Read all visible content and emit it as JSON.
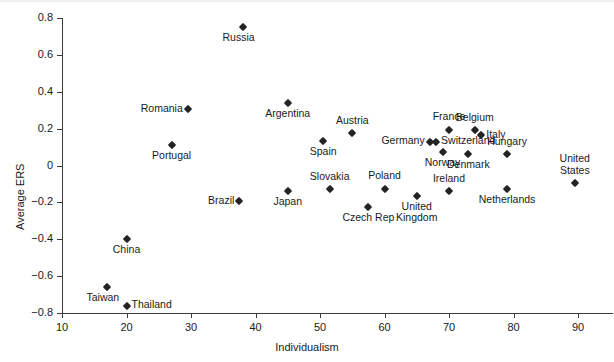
{
  "chart_data": {
    "type": "scatter",
    "title": "",
    "xlabel": "Individualism",
    "ylabel": "Average ERS",
    "xlim": [
      10,
      95
    ],
    "ylim": [
      -0.8,
      0.8
    ],
    "xticks": [
      10,
      20,
      30,
      40,
      50,
      60,
      70,
      80,
      90
    ],
    "xtick_labels": [
      "10",
      "20",
      "30",
      "40",
      "50",
      "60",
      "70",
      "80",
      "90"
    ],
    "yticks": [
      -0.8,
      -0.6,
      -0.4,
      -0.2,
      0,
      0.2,
      0.4,
      0.6,
      0.8
    ],
    "ytick_labels": [
      "−0.8",
      "−0.6",
      "−0.4",
      "−0.2",
      "0",
      "0.2",
      "0.4",
      "0.6",
      "0.8"
    ],
    "grid": false,
    "legend": "none",
    "marker_style": "filled-diamond",
    "marker_color": "#232323",
    "points": [
      {
        "label": "Taiwan",
        "x": 17,
        "y": -0.66,
        "label_pos": "below-left"
      },
      {
        "label": "Thailand",
        "x": 20,
        "y": -0.76,
        "label_pos": "right"
      },
      {
        "label": "China",
        "x": 20,
        "y": -0.4,
        "label_pos": "below"
      },
      {
        "label": "Portugal",
        "x": 27,
        "y": 0.11,
        "label_pos": "below"
      },
      {
        "label": "Romania",
        "x": 29.5,
        "y": 0.305,
        "label_pos": "left"
      },
      {
        "label": "Brazil",
        "x": 37.5,
        "y": -0.195,
        "label_pos": "left"
      },
      {
        "label": "Russia",
        "x": 38,
        "y": 0.75,
        "label_pos": "below-left"
      },
      {
        "label": "Argentina",
        "x": 45,
        "y": 0.34,
        "label_pos": "below"
      },
      {
        "label": "Japan",
        "x": 45,
        "y": -0.14,
        "label_pos": "below"
      },
      {
        "label": "Spain",
        "x": 50.5,
        "y": 0.135,
        "label_pos": "below"
      },
      {
        "label": "Slovakia",
        "x": 51.5,
        "y": -0.13,
        "label_pos": "above"
      },
      {
        "label": "Austria",
        "x": 55,
        "y": 0.175,
        "label_pos": "above"
      },
      {
        "label": "Czech Rep",
        "x": 57.5,
        "y": -0.225,
        "label_pos": "below"
      },
      {
        "label": "Poland",
        "x": 60,
        "y": -0.125,
        "label_pos": "above"
      },
      {
        "label": "United\nKingdom",
        "x": 65,
        "y": -0.165,
        "label_pos": "below"
      },
      {
        "label": "Germany",
        "x": 67,
        "y": 0.13,
        "label_pos": "left"
      },
      {
        "label": "Switzerland",
        "x": 68,
        "y": 0.13,
        "label_pos": "right"
      },
      {
        "label": "Norway",
        "x": 69,
        "y": 0.075,
        "label_pos": "below"
      },
      {
        "label": "Ireland",
        "x": 70,
        "y": -0.14,
        "label_pos": "above"
      },
      {
        "label": "France",
        "x": 70,
        "y": 0.195,
        "label_pos": "above"
      },
      {
        "label": "Denmark",
        "x": 73,
        "y": 0.06,
        "label_pos": "below"
      },
      {
        "label": "Belgium",
        "x": 74,
        "y": 0.19,
        "label_pos": "above"
      },
      {
        "label": "Italy",
        "x": 75,
        "y": 0.165,
        "label_pos": "right"
      },
      {
        "label": "Netherlands",
        "x": 79,
        "y": -0.13,
        "label_pos": "below"
      },
      {
        "label": "Hungary",
        "x": 79,
        "y": 0.06,
        "label_pos": "above"
      },
      {
        "label": "United\nStates",
        "x": 89.5,
        "y": -0.095,
        "label_pos": "above"
      }
    ]
  }
}
